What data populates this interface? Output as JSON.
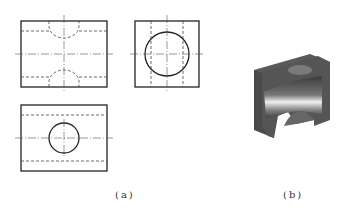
{
  "figure": {
    "labels": {
      "a": "(a)",
      "b": "(b)"
    },
    "colors": {
      "line": "#222222",
      "hidden": "#444444",
      "center": "#555555",
      "solid_dark": "#4a4a4a",
      "solid_light": "#e8e8e8"
    },
    "views": [
      {
        "name": "front-view",
        "description": "rectangle with hidden semicircular cut-outs top and bottom"
      },
      {
        "name": "side-view",
        "description": "square with through-hole circle"
      },
      {
        "name": "top-view",
        "description": "rectangle with circle and hidden horizontal lines"
      }
    ],
    "solid": {
      "name": "isometric-3d-model",
      "description": "block with cylindrical bore"
    }
  }
}
